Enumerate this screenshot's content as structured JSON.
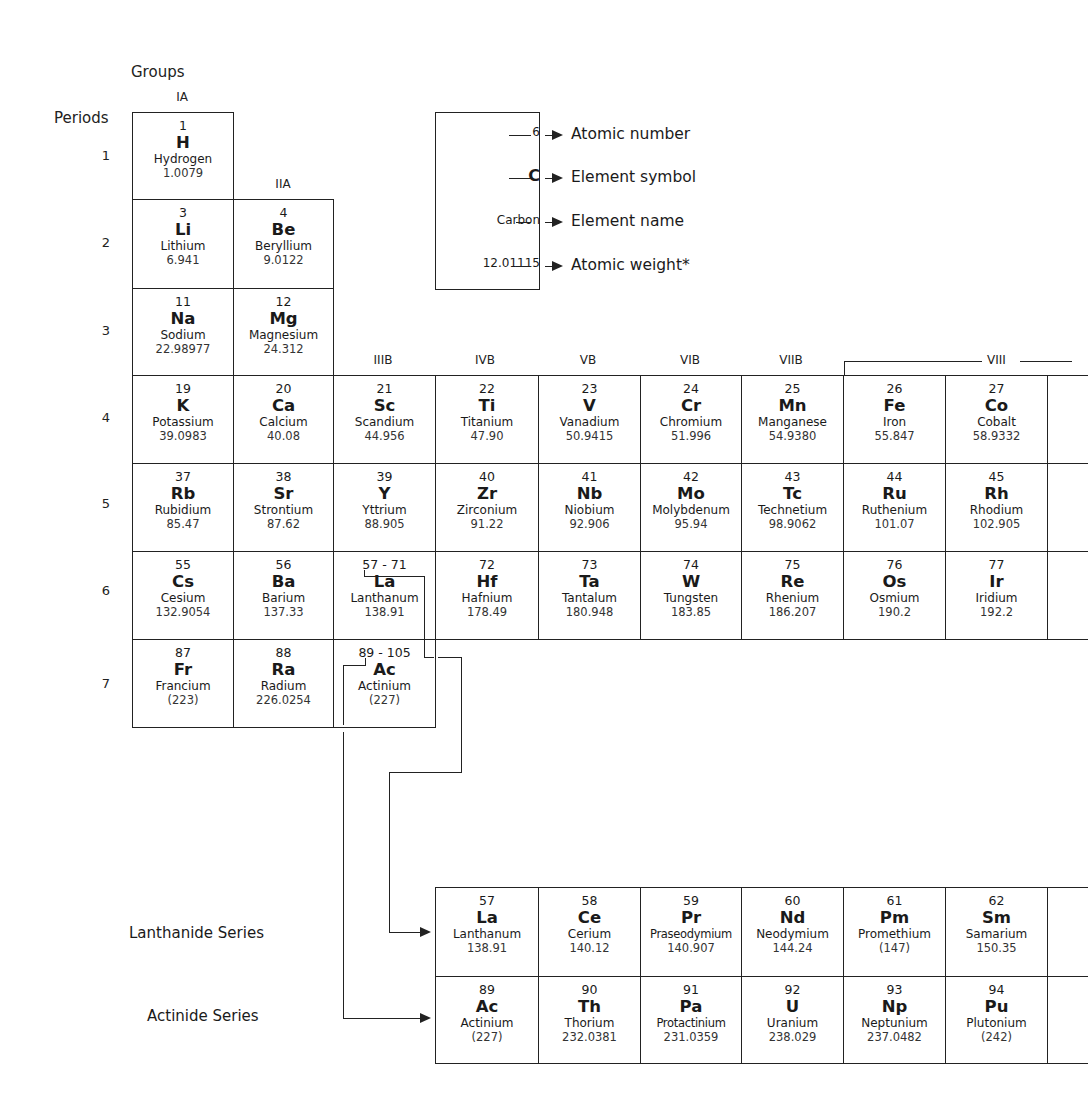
{
  "headers": {
    "groups_label": "Groups",
    "periods_label": "Periods",
    "groups": {
      "IA": "IA",
      "IIA": "IIA",
      "IIIB": "IIIB",
      "IVB": "IVB",
      "VB": "VB",
      "VIB": "VIB",
      "VIIB": "VIIB",
      "VIII": "VIII"
    },
    "periods": [
      "1",
      "2",
      "3",
      "4",
      "5",
      "6",
      "7"
    ]
  },
  "legend": {
    "example": {
      "number": "6",
      "symbol": "C",
      "name": "Carbon",
      "weight": "12.01115"
    },
    "descriptions": {
      "number": "Atomic number",
      "symbol": "Element symbol",
      "name": "Element name",
      "weight": "Atomic weight*"
    }
  },
  "elements": {
    "H": {
      "num": "1",
      "sym": "H",
      "name": "Hydrogen",
      "wt": "1.0079"
    },
    "Li": {
      "num": "3",
      "sym": "Li",
      "name": "Lithium",
      "wt": "6.941"
    },
    "Be": {
      "num": "4",
      "sym": "Be",
      "name": "Beryllium",
      "wt": "9.0122"
    },
    "Na": {
      "num": "11",
      "sym": "Na",
      "name": "Sodium",
      "wt": "22.98977"
    },
    "Mg": {
      "num": "12",
      "sym": "Mg",
      "name": "Magnesium",
      "wt": "24.312"
    },
    "K": {
      "num": "19",
      "sym": "K",
      "name": "Potassium",
      "wt": "39.0983"
    },
    "Ca": {
      "num": "20",
      "sym": "Ca",
      "name": "Calcium",
      "wt": "40.08"
    },
    "Sc": {
      "num": "21",
      "sym": "Sc",
      "name": "Scandium",
      "wt": "44.956"
    },
    "Ti": {
      "num": "22",
      "sym": "Ti",
      "name": "Titanium",
      "wt": "47.90"
    },
    "V": {
      "num": "23",
      "sym": "V",
      "name": "Vanadium",
      "wt": "50.9415"
    },
    "Cr": {
      "num": "24",
      "sym": "Cr",
      "name": "Chromium",
      "wt": "51.996"
    },
    "Mn": {
      "num": "25",
      "sym": "Mn",
      "name": "Manganese",
      "wt": "54.9380"
    },
    "Fe": {
      "num": "26",
      "sym": "Fe",
      "name": "Iron",
      "wt": "55.847"
    },
    "Co": {
      "num": "27",
      "sym": "Co",
      "name": "Cobalt",
      "wt": "58.9332"
    },
    "Rb": {
      "num": "37",
      "sym": "Rb",
      "name": "Rubidium",
      "wt": "85.47"
    },
    "Sr": {
      "num": "38",
      "sym": "Sr",
      "name": "Strontium",
      "wt": "87.62"
    },
    "Y": {
      "num": "39",
      "sym": "Y",
      "name": "Yttrium",
      "wt": "88.905"
    },
    "Zr": {
      "num": "40",
      "sym": "Zr",
      "name": "Zirconium",
      "wt": "91.22"
    },
    "Nb": {
      "num": "41",
      "sym": "Nb",
      "name": "Niobium",
      "wt": "92.906"
    },
    "Mo": {
      "num": "42",
      "sym": "Mo",
      "name": "Molybdenum",
      "wt": "95.94"
    },
    "Tc": {
      "num": "43",
      "sym": "Tc",
      "name": "Technetium",
      "wt": "98.9062"
    },
    "Ru": {
      "num": "44",
      "sym": "Ru",
      "name": "Ruthenium",
      "wt": "101.07"
    },
    "Rh": {
      "num": "45",
      "sym": "Rh",
      "name": "Rhodium",
      "wt": "102.905"
    },
    "Cs": {
      "num": "55",
      "sym": "Cs",
      "name": "Cesium",
      "wt": "132.9054"
    },
    "Ba": {
      "num": "56",
      "sym": "Ba",
      "name": "Barium",
      "wt": "137.33"
    },
    "LaMain": {
      "num": "57 - 71",
      "sym": "La",
      "name": "Lanthanum",
      "wt": "138.91"
    },
    "Hf": {
      "num": "72",
      "sym": "Hf",
      "name": "Hafnium",
      "wt": "178.49"
    },
    "Ta": {
      "num": "73",
      "sym": "Ta",
      "name": "Tantalum",
      "wt": "180.948"
    },
    "W": {
      "num": "74",
      "sym": "W",
      "name": "Tungsten",
      "wt": "183.85"
    },
    "Re": {
      "num": "75",
      "sym": "Re",
      "name": "Rhenium",
      "wt": "186.207"
    },
    "Os": {
      "num": "76",
      "sym": "Os",
      "name": "Osmium",
      "wt": "190.2"
    },
    "Ir": {
      "num": "77",
      "sym": "Ir",
      "name": "Iridium",
      "wt": "192.2"
    },
    "Fr": {
      "num": "87",
      "sym": "Fr",
      "name": "Francium",
      "wt": "(223)"
    },
    "Ra": {
      "num": "88",
      "sym": "Ra",
      "name": "Radium",
      "wt": "226.0254"
    },
    "AcMain": {
      "num": "89 - 105",
      "sym": "Ac",
      "name": "Actinium",
      "wt": "(227)"
    }
  },
  "series": {
    "lanthanide_label": "Lanthanide Series",
    "actinide_label": "Actinide Series",
    "lanthanides": [
      {
        "num": "57",
        "sym": "La",
        "name": "Lanthanum",
        "wt": "138.91"
      },
      {
        "num": "58",
        "sym": "Ce",
        "name": "Cerium",
        "wt": "140.12"
      },
      {
        "num": "59",
        "sym": "Pr",
        "name": "Praseodymium",
        "wt": "140.907"
      },
      {
        "num": "60",
        "sym": "Nd",
        "name": "Neodymium",
        "wt": "144.24"
      },
      {
        "num": "61",
        "sym": "Pm",
        "name": "Promethium",
        "wt": "(147)"
      },
      {
        "num": "62",
        "sym": "Sm",
        "name": "Samarium",
        "wt": "150.35"
      }
    ],
    "actinides": [
      {
        "num": "89",
        "sym": "Ac",
        "name": "Actinium",
        "wt": "(227)"
      },
      {
        "num": "90",
        "sym": "Th",
        "name": "Thorium",
        "wt": "232.0381"
      },
      {
        "num": "91",
        "sym": "Pa",
        "name": "Protactinium",
        "wt": "231.0359"
      },
      {
        "num": "92",
        "sym": "U",
        "name": "Uranium",
        "wt": "238.029"
      },
      {
        "num": "93",
        "sym": "Np",
        "name": "Neptunium",
        "wt": "237.0482"
      },
      {
        "num": "94",
        "sym": "Pu",
        "name": "Plutonium",
        "wt": "(242)"
      }
    ]
  }
}
